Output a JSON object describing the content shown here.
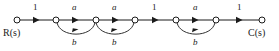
{
  "diagram": {
    "type": "signal-flow-graph",
    "title": "",
    "input_label": "R(s)",
    "output_label": "C(s)",
    "colors": {
      "stroke": "#1b1b1b",
      "background": "#ffffff",
      "node_fill": "#ffffff"
    },
    "nodes": [
      {
        "id": "n1",
        "x": 17,
        "y": 20,
        "r": 3,
        "label": "R(s)"
      },
      {
        "id": "n2",
        "x": 56,
        "y": 20,
        "r": 3,
        "label": ""
      },
      {
        "id": "n3",
        "x": 96,
        "y": 20,
        "r": 3,
        "label": ""
      },
      {
        "id": "n4",
        "x": 135,
        "y": 20,
        "r": 3,
        "label": ""
      },
      {
        "id": "n5",
        "x": 176,
        "y": 20,
        "r": 3,
        "label": ""
      },
      {
        "id": "n6",
        "x": 216,
        "y": 20,
        "r": 3,
        "label": ""
      },
      {
        "id": "n7",
        "x": 262,
        "y": 20,
        "r": 3,
        "label": "C(s)"
      }
    ],
    "forward_branches": [
      {
        "from": "n1",
        "to": "n2",
        "gain": "1",
        "gain_x": 35,
        "gain_y": 4,
        "italic": false
      },
      {
        "from": "n2",
        "to": "n3",
        "gain": "a",
        "gain_x": 74,
        "gain_y": 4,
        "italic": true
      },
      {
        "from": "n3",
        "to": "n4",
        "gain": "a",
        "gain_x": 114,
        "gain_y": 4,
        "italic": true
      },
      {
        "from": "n4",
        "to": "n5",
        "gain": "1",
        "gain_x": 154,
        "gain_y": 4,
        "italic": false
      },
      {
        "from": "n5",
        "to": "n6",
        "gain": "a",
        "gain_x": 195,
        "gain_y": 4,
        "italic": true
      },
      {
        "from": "n6",
        "to": "n7",
        "gain": "1",
        "gain_x": 239,
        "gain_y": 4,
        "italic": false
      }
    ],
    "feedback_branches": [
      {
        "from": "n3",
        "to": "n2",
        "gain": "b",
        "gain_x": 73,
        "gain_y": 38,
        "depth": 16
      },
      {
        "from": "n4",
        "to": "n3",
        "gain": "b",
        "gain_x": 113,
        "gain_y": 38,
        "depth": 16
      },
      {
        "from": "n6",
        "to": "n5",
        "gain": "b",
        "gain_x": 194,
        "gain_y": 38,
        "depth": 16
      }
    ],
    "terminal_labels": [
      {
        "name": "input",
        "text": "R(s)",
        "x": 5,
        "y": 28
      },
      {
        "name": "output",
        "text": "C(s)",
        "x": 249,
        "y": 28
      }
    ]
  }
}
